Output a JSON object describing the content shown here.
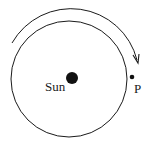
{
  "diagram": {
    "type": "orbit",
    "labels": {
      "sun": "Sun",
      "point": "P"
    },
    "colors": {
      "stroke": "#1a1a1a",
      "background": "#ffffff"
    },
    "direction": "clockwise"
  }
}
